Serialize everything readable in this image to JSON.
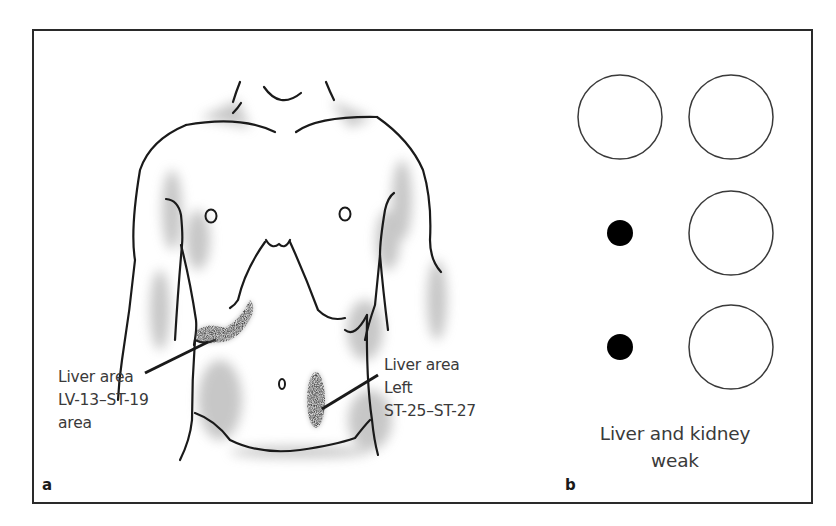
{
  "figure": {
    "panel_a": {
      "letter": "a",
      "labels": {
        "right_ribcage": {
          "line1": "Liver area",
          "line2": "LV-13–ST-19",
          "line3": "area"
        },
        "left_lower_abdomen": {
          "line1": "Liver area",
          "line2": "Left",
          "line3": "ST-25–ST-27"
        }
      }
    },
    "panel_b": {
      "letter": "b",
      "caption_line1": "Liver and kidney",
      "caption_line2": "weak",
      "grid": [
        {
          "row": 1,
          "left": "open-circle",
          "right": "open-circle"
        },
        {
          "row": 2,
          "left": "filled-dot",
          "right": "open-circle"
        },
        {
          "row": 3,
          "left": "filled-dot",
          "right": "open-circle"
        }
      ]
    },
    "colors": {
      "line": "#1a1a1a",
      "text": "#3a3a3a",
      "shading": "#8a8a8a"
    }
  }
}
